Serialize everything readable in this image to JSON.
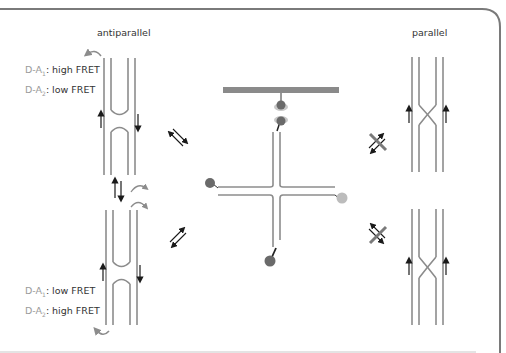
{
  "figure": {
    "labels": {
      "antiparallel": "antiparallel",
      "parallel": "parallel"
    },
    "top_left_state": {
      "line1": {
        "prefix": "D-A",
        "sub": "1",
        "value": ": high FRET"
      },
      "line2": {
        "prefix": "D-A",
        "sub": "2",
        "value": ": low FRET"
      }
    },
    "bottom_left_state": {
      "line1": {
        "prefix": "D-A",
        "sub": "1",
        "value": ": low FRET"
      },
      "line2": {
        "prefix": "D-A",
        "sub": "2",
        "value": ": high FRET"
      }
    },
    "colors": {
      "strand": "#8c8c8c",
      "frame": "#7a7a7a",
      "surface": "#8a8a8a",
      "donor_dark": "#6a6a6a",
      "acceptor_light": "#bcbcbc",
      "arrow": "#1a1a1a",
      "text": "#333333",
      "text_muted": "#9a9a9a"
    },
    "transitions": {
      "left_top": "equilibrium-arrows",
      "left_bottom": "equilibrium-arrows",
      "right_top": "blocked-equilibrium",
      "right_bottom": "blocked-equilibrium",
      "antiparallel_interconversion": "equilibrium-arrows"
    }
  }
}
